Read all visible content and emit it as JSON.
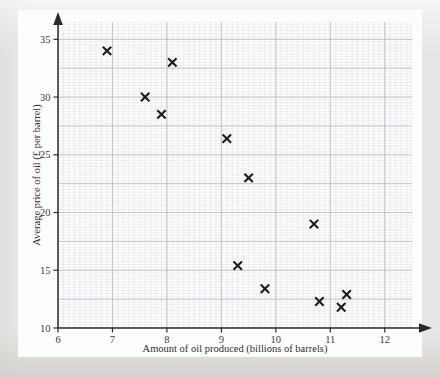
{
  "figure": {
    "kind": "scatter-graph",
    "background_color": "#e9e7e5",
    "sheet_color": "#fdfdfd",
    "marker_color": "#1c1c1c",
    "axis_color": "#2b2b2b",
    "major_grid_color": "#b9bcc4",
    "minor_grid_color": "#dcdfe6"
  },
  "chart_data": {
    "type": "scatter",
    "title": "",
    "xlabel": "Amount of oil produced (billions of barrels)",
    "ylabel": "Average price of oil (£ per barrel)",
    "xlim": [
      6,
      12.5
    ],
    "ylim": [
      10,
      36.5
    ],
    "xticks": [
      6,
      7,
      8,
      9,
      10,
      11,
      12
    ],
    "xtick_labels": [
      "6",
      "7",
      "8",
      "9",
      "10",
      "11",
      "12"
    ],
    "yticks": [
      10,
      15,
      20,
      25,
      30,
      35
    ],
    "ytick_labels": [
      "10",
      "15",
      "20",
      "25",
      "30",
      "35"
    ],
    "grid": true,
    "major_grid_x_step": 1,
    "major_grid_y_step": 2.5,
    "minor_grid_x_step": 0.1,
    "minor_grid_y_step": 0.25,
    "legend": null,
    "marker_style": "x",
    "points": [
      {
        "x": 6.9,
        "y": 34.0
      },
      {
        "x": 7.6,
        "y": 30.0
      },
      {
        "x": 7.9,
        "y": 28.5
      },
      {
        "x": 8.1,
        "y": 33.0
      },
      {
        "x": 9.1,
        "y": 26.4
      },
      {
        "x": 9.5,
        "y": 23.0
      },
      {
        "x": 9.3,
        "y": 15.4
      },
      {
        "x": 9.8,
        "y": 13.4
      },
      {
        "x": 10.7,
        "y": 19.0
      },
      {
        "x": 10.8,
        "y": 12.3
      },
      {
        "x": 11.2,
        "y": 11.8
      },
      {
        "x": 11.3,
        "y": 12.9
      }
    ]
  }
}
